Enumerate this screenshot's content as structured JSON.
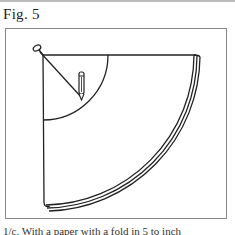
{
  "figure": {
    "label": "Fig. 5",
    "caption": "1/c. With a paper with a fold in 5 to inch"
  },
  "drawing": {
    "description": "Pencil-and-string compass drawing quarter-circle arcs on a sheet",
    "elements": [
      "pin",
      "string",
      "pencil",
      "inner-arc",
      "outer-arc-band"
    ]
  }
}
